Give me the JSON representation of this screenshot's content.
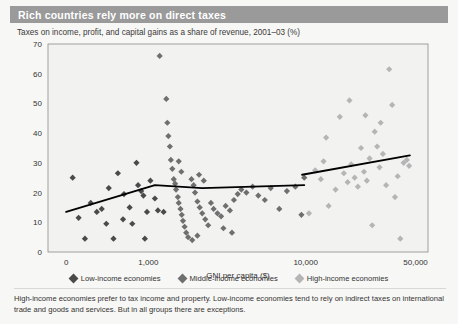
{
  "header": {
    "title": "Rich countries rely more on direct taxes"
  },
  "subtitle": "Taxes on income, profit, and capital gains as a share of revenue, 2001–03 (%)",
  "footnote": "High-income economies prefer to tax income and property. Low-income economies tend to rely on indirect taxes on international trade and goods and services. But in all groups there are exceptions.",
  "colors": {
    "header_bar": "#9a9a9a",
    "header_text": "#ffffff",
    "panel_background": "#f7f7f5",
    "plot_background": "#f2f2f0",
    "axis": "#8a8a8a",
    "trend_line": "#000000",
    "low_income": "#4a4a4a",
    "middle_income": "#6f6f6f",
    "high_income": "#b5b5b5"
  },
  "legend": {
    "position": "bottom-center",
    "items": [
      {
        "label": "Low-income economies",
        "color": "#4a4a4a",
        "marker": "diamond"
      },
      {
        "label": "Middle-income economies",
        "color": "#6f6f6f",
        "marker": "diamond"
      },
      {
        "label": "High-income economies",
        "color": "#b5b5b5",
        "marker": "diamond"
      }
    ]
  },
  "chart_data": {
    "type": "scatter",
    "title": "Rich countries rely more on direct taxes",
    "subtitle": "Taxes on income, profit, and capital gains as a share of revenue, 2001–03 (%)",
    "xlabel": "GNI per capita ($)",
    "ylabel": "",
    "xscale": "log",
    "xlim": [
      230,
      60000
    ],
    "ylim": [
      0,
      70
    ],
    "grid": false,
    "xticks": [
      {
        "value": 300,
        "label": "0"
      },
      {
        "value": 1000,
        "label": "1,000"
      },
      {
        "value": 10000,
        "label": "10,000"
      },
      {
        "value": 50000,
        "label": "50,000"
      }
    ],
    "yticks": [
      0,
      10,
      20,
      30,
      40,
      50,
      60,
      70
    ],
    "series": [
      {
        "name": "Low-income economies",
        "color": "#4a4a4a",
        "marker": "diamond",
        "points": [
          [
            330,
            25.0
          ],
          [
            360,
            11.5
          ],
          [
            395,
            4.5
          ],
          [
            430,
            16.5
          ],
          [
            470,
            13.5
          ],
          [
            505,
            14.5
          ],
          [
            540,
            9.5
          ],
          [
            560,
            21.5
          ],
          [
            600,
            4.5
          ],
          [
            640,
            26.5
          ],
          [
            690,
            11.0
          ],
          [
            700,
            19.5
          ],
          [
            760,
            15.0
          ],
          [
            790,
            9.5
          ],
          [
            840,
            30.0
          ],
          [
            860,
            22.5
          ],
          [
            900,
            20.5
          ],
          [
            930,
            19.0
          ],
          [
            950,
            4.5
          ],
          [
            980,
            13.5
          ],
          [
            1030,
            24.0
          ],
          [
            1100,
            18.0
          ],
          [
            1150,
            14.0
          ],
          [
            1250,
            13.5
          ]
        ]
      },
      {
        "name": "Middle-income economies",
        "color": "#6f6f6f",
        "marker": "diamond",
        "points": [
          [
            1180,
            66.0
          ],
          [
            1300,
            51.5
          ],
          [
            1320,
            43.5
          ],
          [
            1340,
            39.0
          ],
          [
            1370,
            35.5
          ],
          [
            1390,
            31.0
          ],
          [
            1420,
            28.0
          ],
          [
            1450,
            24.5
          ],
          [
            1480,
            23.0
          ],
          [
            1500,
            21.0
          ],
          [
            1540,
            18.5
          ],
          [
            1560,
            16.5
          ],
          [
            1600,
            14.5
          ],
          [
            1630,
            12.5
          ],
          [
            1660,
            10.5
          ],
          [
            1700,
            8.5
          ],
          [
            1740,
            6.5
          ],
          [
            1790,
            5.0
          ],
          [
            1560,
            30.5
          ],
          [
            1620,
            27.0
          ],
          [
            1880,
            24.5
          ],
          [
            1940,
            22.5
          ],
          [
            1980,
            20.0
          ],
          [
            2050,
            17.0
          ],
          [
            2120,
            15.0
          ],
          [
            2200,
            13.0
          ],
          [
            2300,
            11.0
          ],
          [
            2400,
            9.0
          ],
          [
            2100,
            26.0
          ],
          [
            2250,
            24.0
          ],
          [
            2500,
            16.5
          ],
          [
            2600,
            14.5
          ],
          [
            2750,
            13.0
          ],
          [
            2900,
            12.0
          ],
          [
            3100,
            15.5
          ],
          [
            3300,
            14.0
          ],
          [
            3500,
            17.5
          ],
          [
            3700,
            19.5
          ],
          [
            3900,
            21.0
          ],
          [
            4200,
            20.0
          ],
          [
            4600,
            22.0
          ],
          [
            5000,
            19.0
          ],
          [
            5500,
            17.5
          ],
          [
            6000,
            21.5
          ],
          [
            6800,
            14.5
          ],
          [
            7600,
            20.5
          ],
          [
            8600,
            22.0
          ],
          [
            9400,
            12.5
          ],
          [
            3000,
            8.0
          ],
          [
            3400,
            6.5
          ],
          [
            2050,
            5.5
          ],
          [
            1900,
            4.0
          ],
          [
            9800,
            25.0
          ]
        ]
      },
      {
        "name": "High-income economies",
        "color": "#b5b5b5",
        "marker": "diamond",
        "points": [
          [
            10500,
            13.0
          ],
          [
            11500,
            27.5
          ],
          [
            12500,
            24.5
          ],
          [
            13000,
            30.5
          ],
          [
            14000,
            15.5
          ],
          [
            15500,
            21.0
          ],
          [
            16500,
            45.5
          ],
          [
            17500,
            26.5
          ],
          [
            18500,
            23.5
          ],
          [
            19500,
            29.5
          ],
          [
            20500,
            25.0
          ],
          [
            21500,
            22.0
          ],
          [
            22500,
            35.0
          ],
          [
            23500,
            27.0
          ],
          [
            24500,
            24.0
          ],
          [
            25500,
            31.5
          ],
          [
            26500,
            9.0
          ],
          [
            27500,
            40.5
          ],
          [
            28500,
            35.5
          ],
          [
            29500,
            28.5
          ],
          [
            31000,
            33.0
          ],
          [
            32500,
            22.5
          ],
          [
            34000,
            61.5
          ],
          [
            35500,
            49.5
          ],
          [
            37000,
            18.5
          ],
          [
            38500,
            25.5
          ],
          [
            40000,
            4.5
          ],
          [
            42000,
            30.0
          ],
          [
            44000,
            31.0
          ],
          [
            45500,
            29.0
          ],
          [
            13500,
            38.5
          ],
          [
            19000,
            51.0
          ],
          [
            24000,
            46.0
          ],
          [
            30000,
            43.5
          ]
        ]
      }
    ],
    "trend_lines": [
      {
        "name": "Low and middle income trend",
        "color": "#000000",
        "points": [
          [
            300,
            13.5
          ],
          [
            1100,
            22.5
          ],
          [
            2200,
            21.5
          ],
          [
            9800,
            22.5
          ]
        ]
      },
      {
        "name": "High income trend",
        "color": "#000000",
        "points": [
          [
            9500,
            26.0
          ],
          [
            46000,
            32.5
          ]
        ]
      }
    ]
  }
}
